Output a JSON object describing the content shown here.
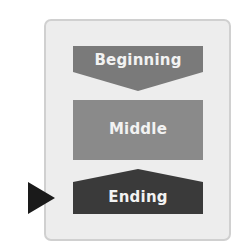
{
  "diagram": {
    "type": "story-structure",
    "steps": [
      {
        "label": "Beginning",
        "color": "#7a7a7a"
      },
      {
        "label": "Middle",
        "color": "#8a8a8a"
      },
      {
        "label": "Ending",
        "color": "#3a3a3a"
      }
    ],
    "current_step_marker": {
      "icon": "play-triangle-icon",
      "points_to": "Ending",
      "color": "#1a1a1a"
    },
    "frame_color": "#ededed"
  }
}
